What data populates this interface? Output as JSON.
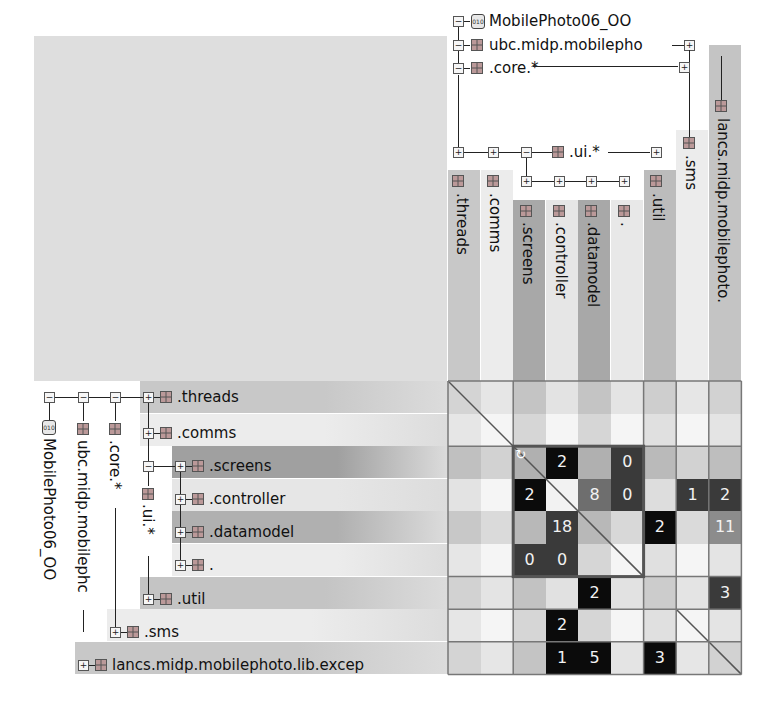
{
  "project": {
    "name": "MobilePhoto06_OO",
    "icon": "jar-icon"
  },
  "column_tree": {
    "root": "MobilePhoto06_OO",
    "package": "ubc.midp.mobilepho",
    "core": ".core.*",
    "ui": ".ui.*",
    "external": "lancs.midp.mobilephoto.",
    "leaves": [
      ".threads",
      ".comms",
      ".screens",
      ".controller",
      ".datamodel",
      ".",
      ".util",
      ".sms",
      "lancs.midp.mobilephoto."
    ]
  },
  "row_tree": {
    "root": "MobilePhoto06_OO",
    "package": "ubc.midp.mobilephc",
    "core": ".core.*",
    "ui": ".ui.*",
    "rows": [
      {
        "label": ".threads"
      },
      {
        "label": ".comms"
      },
      {
        "label": ".screens"
      },
      {
        "label": ".controller"
      },
      {
        "label": ".datamodel"
      },
      {
        "label": "."
      },
      {
        "label": ".util"
      },
      {
        "label": ".sms"
      },
      {
        "label": "lancs.midp.mobilephoto.lib.excep"
      }
    ]
  },
  "matrix": {
    "cells": [
      {
        "row": 2,
        "col": 3,
        "value": "2",
        "style": "black"
      },
      {
        "row": 2,
        "col": 5,
        "value": "0",
        "style": "dark"
      },
      {
        "row": 3,
        "col": 2,
        "value": "2",
        "style": "black"
      },
      {
        "row": 3,
        "col": 4,
        "value": "8",
        "style": "mid"
      },
      {
        "row": 3,
        "col": 5,
        "value": "0",
        "style": "dark"
      },
      {
        "row": 3,
        "col": 7,
        "value": "1",
        "style": "dark"
      },
      {
        "row": 3,
        "col": 8,
        "value": "2",
        "style": "dark"
      },
      {
        "row": 4,
        "col": 3,
        "value": "18",
        "style": "dark"
      },
      {
        "row": 4,
        "col": 6,
        "value": "2",
        "style": "black"
      },
      {
        "row": 4,
        "col": 8,
        "value": "11",
        "style": "light"
      },
      {
        "row": 5,
        "col": 2,
        "value": "0",
        "style": "dark"
      },
      {
        "row": 5,
        "col": 3,
        "value": "0",
        "style": "dark"
      },
      {
        "row": 6,
        "col": 4,
        "value": "2",
        "style": "black"
      },
      {
        "row": 6,
        "col": 8,
        "value": "3",
        "style": "dark"
      },
      {
        "row": 7,
        "col": 3,
        "value": "2",
        "style": "black"
      },
      {
        "row": 8,
        "col": 3,
        "value": "1",
        "style": "black"
      },
      {
        "row": 8,
        "col": 4,
        "value": "5",
        "style": "black"
      },
      {
        "row": 8,
        "col": 6,
        "value": "3",
        "style": "black"
      }
    ],
    "cycle_icon": "cycle-icon"
  },
  "colors": {
    "black": "#0b0b0b",
    "dark": "#3a3a3a",
    "mid": "#6e6e6e",
    "light": "#8c8c8c",
    "corner": "#dedede"
  }
}
